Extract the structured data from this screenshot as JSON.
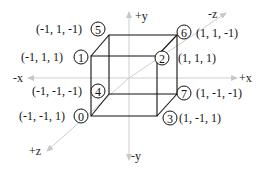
{
  "diagram": {
    "axes": {
      "pos_y": "+y",
      "neg_y": "-y",
      "pos_x": "+x",
      "neg_x": "-x",
      "pos_z": "+z",
      "neg_z": "-z"
    },
    "vertices": [
      {
        "index": "0",
        "coord": "(-1, -1, 1)"
      },
      {
        "index": "1",
        "coord": "(-1, 1, 1)"
      },
      {
        "index": "2",
        "coord": "(1, 1, 1)"
      },
      {
        "index": "3",
        "coord": "(1, -1, 1)"
      },
      {
        "index": "4",
        "coord": "(-1, -1, -1)"
      },
      {
        "index": "5",
        "coord": "(-1, 1, -1)"
      },
      {
        "index": "6",
        "coord": "(1, 1, -1)"
      },
      {
        "index": "7",
        "coord": "(1, -1, -1)"
      }
    ],
    "colors": {
      "axis": "#c8c8c8",
      "cube": "#111111"
    }
  }
}
